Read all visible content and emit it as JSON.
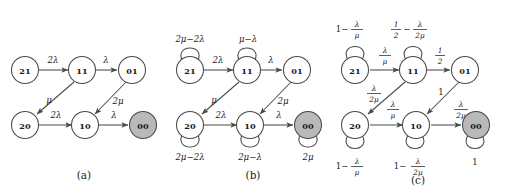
{
  "figure": {
    "width": 511,
    "height": 196,
    "background": "#ffffff",
    "stroke_color": "#4a4a4a",
    "shaded_node_fill": "#b9b9b9",
    "text_color": "#1a1a1a"
  },
  "panels": [
    {
      "id": "a",
      "caption": "(a)",
      "nodes": [
        {
          "id": "21",
          "label": "21",
          "shaded": false
        },
        {
          "id": "11",
          "label": "11",
          "shaded": false
        },
        {
          "id": "01",
          "label": "01",
          "shaded": false
        },
        {
          "id": "20",
          "label": "20",
          "shaded": false
        },
        {
          "id": "10",
          "label": "10",
          "shaded": false
        },
        {
          "id": "00",
          "label": "00",
          "shaded": true
        }
      ],
      "edges": [
        {
          "from": "21",
          "to": "11",
          "label": "2λ"
        },
        {
          "from": "11",
          "to": "01",
          "label": "λ"
        },
        {
          "from": "11",
          "to": "20",
          "label": "μ"
        },
        {
          "from": "20",
          "to": "10",
          "label": "2λ"
        },
        {
          "from": "01",
          "to": "10",
          "label": "2μ"
        },
        {
          "from": "10",
          "to": "00",
          "label": "λ"
        }
      ],
      "self_loops": []
    },
    {
      "id": "b",
      "caption": "(b)",
      "nodes": [
        {
          "id": "21",
          "label": "21",
          "shaded": false
        },
        {
          "id": "11",
          "label": "11",
          "shaded": false
        },
        {
          "id": "01",
          "label": "01",
          "shaded": false
        },
        {
          "id": "20",
          "label": "20",
          "shaded": false
        },
        {
          "id": "10",
          "label": "10",
          "shaded": false
        },
        {
          "id": "00",
          "label": "00",
          "shaded": true
        }
      ],
      "edges": [
        {
          "from": "21",
          "to": "11",
          "label": "2λ"
        },
        {
          "from": "11",
          "to": "01",
          "label": "λ"
        },
        {
          "from": "11",
          "to": "20",
          "label": "μ"
        },
        {
          "from": "20",
          "to": "10",
          "label": "2λ"
        },
        {
          "from": "01",
          "to": "10",
          "label": "2μ"
        },
        {
          "from": "10",
          "to": "00",
          "label": "λ"
        }
      ],
      "self_loops": [
        {
          "node": "21",
          "position": "top",
          "label": "2μ−2λ"
        },
        {
          "node": "11",
          "position": "top",
          "label": "μ−λ"
        },
        {
          "node": "20",
          "position": "bottom",
          "label": "2μ−2λ"
        },
        {
          "node": "10",
          "position": "bottom",
          "label": "2μ−λ"
        },
        {
          "node": "00",
          "position": "bottom",
          "label": "2μ"
        }
      ]
    },
    {
      "id": "c",
      "caption": "(c)",
      "nodes": [
        {
          "id": "21",
          "label": "21",
          "shaded": false
        },
        {
          "id": "11",
          "label": "11",
          "shaded": false
        },
        {
          "id": "01",
          "label": "01",
          "shaded": false
        },
        {
          "id": "20",
          "label": "20",
          "shaded": false
        },
        {
          "id": "10",
          "label": "10",
          "shaded": false
        },
        {
          "id": "00",
          "label": "00",
          "shaded": true
        }
      ],
      "edges": [
        {
          "from": "21",
          "to": "11",
          "lead": "",
          "num": "λ",
          "den": "μ"
        },
        {
          "from": "11",
          "to": "01",
          "lead": "",
          "num": "1",
          "den": "2"
        },
        {
          "from": "11",
          "to": "20",
          "lead": "",
          "num": "λ",
          "den": "2μ"
        },
        {
          "from": "20",
          "to": "10",
          "lead": "",
          "num": "λ",
          "den": "μ"
        },
        {
          "from": "01",
          "to": "10",
          "lead": "1",
          "num": "",
          "den": ""
        },
        {
          "from": "10",
          "to": "00",
          "lead": "",
          "num": "λ",
          "den": "2μ"
        }
      ],
      "self_loops": [
        {
          "node": "21",
          "position": "top",
          "lead": "1−",
          "num": "λ",
          "den": "μ"
        },
        {
          "node": "11",
          "position": "top",
          "lead": "",
          "num1": "1",
          "den1": "2",
          "mid": "−",
          "num": "λ",
          "den": "2μ"
        },
        {
          "node": "20",
          "position": "bottom",
          "lead": "1−",
          "num": "λ",
          "den": "μ"
        },
        {
          "node": "10",
          "position": "bottom",
          "lead": "1−",
          "num": "λ",
          "den": "2μ"
        },
        {
          "node": "00",
          "position": "bottom",
          "lead": "1",
          "num": "",
          "den": ""
        }
      ]
    }
  ]
}
